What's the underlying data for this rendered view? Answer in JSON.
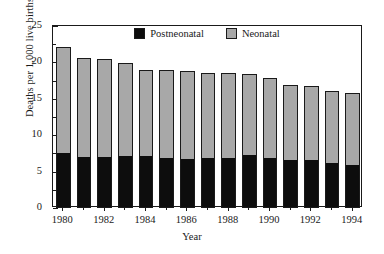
{
  "chart_data": {
    "type": "bar",
    "subtype": "stacked-vertical",
    "title": "",
    "xlabel": "Year",
    "ylabel": "Deaths per 1,000 live births",
    "categories": [
      "1980",
      "1981",
      "1982",
      "1983",
      "1984",
      "1985",
      "1986",
      "1987",
      "1988",
      "1989",
      "1990",
      "1991",
      "1992",
      "1993",
      "1994"
    ],
    "x_tick_labels": [
      "1980",
      "1982",
      "1984",
      "1986",
      "1988",
      "1990",
      "1992",
      "1994"
    ],
    "x_tick_label_years": [
      1980,
      1982,
      1984,
      1986,
      1988,
      1990,
      1992,
      1994
    ],
    "y_tick_labels": [
      "0",
      "5",
      "10",
      "15",
      "20",
      "25"
    ],
    "y_ticks": [
      0,
      5,
      10,
      15,
      20,
      25
    ],
    "y_minor_ticks": [
      2.5,
      7.5,
      12.5,
      17.5,
      22.5
    ],
    "ylim": [
      0,
      25
    ],
    "grid": false,
    "legend_position": "top-center-inside",
    "series": [
      {
        "name": "Postneonatal",
        "color": "#0d0d0d",
        "values": [
          7.5,
          6.9,
          7.0,
          7.1,
          7.1,
          6.9,
          6.7,
          6.8,
          6.9,
          7.2,
          6.9,
          6.6,
          6.5,
          6.2,
          5.9
        ]
      },
      {
        "name": "Neonatal",
        "color": "#a8a8a8",
        "values": [
          14.6,
          13.7,
          13.5,
          12.8,
          11.9,
          12.0,
          12.1,
          11.8,
          11.6,
          11.2,
          10.9,
          10.3,
          10.2,
          9.9,
          9.9
        ]
      }
    ],
    "totals": [
      22.1,
      20.6,
      20.5,
      19.9,
      19.0,
      18.9,
      18.8,
      18.6,
      18.5,
      18.4,
      17.8,
      16.9,
      16.7,
      16.1,
      15.8
    ],
    "legend_entries": [
      {
        "label": "Postneonatal",
        "color": "#0d0d0d"
      },
      {
        "label": "Neonatal",
        "color": "#a8a8a8"
      }
    ]
  },
  "axes": {
    "y_axis_label": "Deaths per 1,000 live births",
    "x_axis_label": "Year"
  }
}
